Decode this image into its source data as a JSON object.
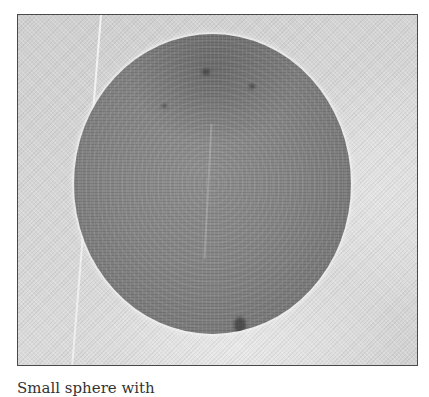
{
  "figure": {
    "frame_border_color": "#4a4a4a",
    "background_color": "#d4d4d4",
    "sphere_color": "#858585"
  },
  "caption": {
    "text": "Small sphere with"
  }
}
